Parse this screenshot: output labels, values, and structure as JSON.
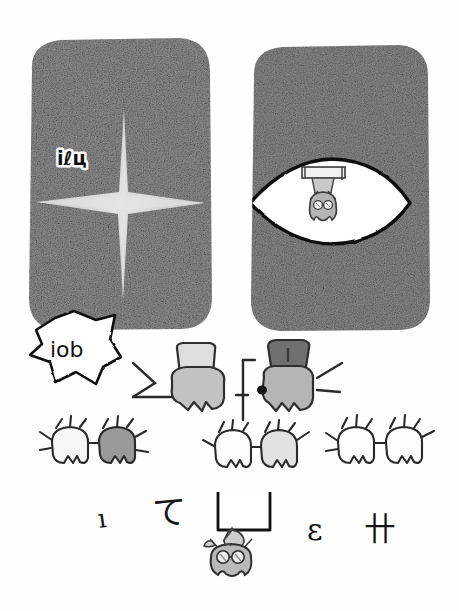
{
  "artwork": {
    "title": "Hand-drawn comic sketch: two grainy panels with creatures",
    "medium": "pencil-sketch",
    "background_color": "#fefefe",
    "ink_color": "#1a1a1a"
  },
  "panels": [
    {
      "id": "left-panel",
      "label": "left-grainy-panel",
      "x": 26,
      "y": 38,
      "width": 188,
      "height": 293,
      "fill": "#8f8f8f",
      "texture": "heavy-noise",
      "contents": {
        "sparkle": {
          "label": "cross-sparkle-shape",
          "center_x": 124,
          "center_y": 205,
          "color": "#d8d8d8"
        },
        "caption": {
          "label": "panel-caption-text",
          "text": "iℓц",
          "x": 57,
          "y": 158,
          "style": "outlined-handwritten"
        }
      }
    },
    {
      "id": "right-panel",
      "label": "right-grainy-panel",
      "x": 248,
      "y": 45,
      "width": 184,
      "height": 286,
      "fill": "#8a8a8a",
      "texture": "heavy-noise",
      "contents": {
        "eye_opening": {
          "label": "eye-shaped-white-opening",
          "center_x": 330,
          "center_y": 202,
          "rx": 82,
          "ry": 41,
          "fill": "#ffffff",
          "stroke": "#111111"
        },
        "hanging_creature": {
          "label": "hanging-bat-creature",
          "x": 296,
          "y": 170,
          "body_fill": "#b4b4b4",
          "has_goggles": true,
          "bar_fill": "#e9e9e9"
        }
      }
    }
  ],
  "speech_bubble": {
    "label": "jagged-speech-bubble",
    "x": 30,
    "y": 312,
    "width": 88,
    "height": 72,
    "fill": "#ffffff",
    "stroke": "#111111",
    "text": "iοb"
  },
  "figures": {
    "big_left": {
      "label": "big-figure-light",
      "body_x": 175,
      "body_y": 368,
      "head_fill": "#dedede",
      "body_fill": "#c2c2c2",
      "arms": "raised-outward"
    },
    "big_right": {
      "label": "big-figure-dark-head",
      "body_x": 285,
      "body_y": 368,
      "head_fill": "#707070",
      "body_fill": "#b5b5b5",
      "arms": "raised-outward",
      "has_dark_dot": true
    },
    "small_creatures": [
      {
        "label": "small-creature-1",
        "x": 62,
        "y": 440,
        "fill": "#f6f6f6"
      },
      {
        "label": "small-creature-2",
        "x": 110,
        "y": 440,
        "fill": "#9a9a9a"
      },
      {
        "label": "small-creature-3",
        "x": 225,
        "y": 443,
        "fill": "#fdfdfd"
      },
      {
        "label": "small-creature-4",
        "x": 272,
        "y": 443,
        "fill": "#e2e2e2"
      },
      {
        "label": "small-creature-5",
        "x": 348,
        "y": 440,
        "fill": "#fdfdfd"
      },
      {
        "label": "small-creature-6",
        "x": 398,
        "y": 440,
        "fill": "#fdfdfd"
      }
    ]
  },
  "bottom_scene": {
    "ledge": {
      "label": "ceiling-ledge",
      "x": 218,
      "y": 493,
      "width": 52,
      "height": 36,
      "fill": "#ffffff",
      "stroke": "#111111"
    },
    "hanging_creature": {
      "label": "bottom-hanging-creature",
      "x": 210,
      "y": 525,
      "body_fill": "#b9b9b9",
      "has_goggles": true
    },
    "glyphs": [
      {
        "label": "glyph-left-1",
        "text": "ı",
        "x": 104,
        "y": 524,
        "rotation": -10
      },
      {
        "label": "glyph-left-2",
        "text": "て",
        "x": 158,
        "y": 512,
        "rotation": 0
      },
      {
        "label": "glyph-right-1",
        "text": "ε",
        "x": 314,
        "y": 534,
        "rotation": 0
      },
      {
        "label": "glyph-right-2",
        "text": "卄",
        "x": 370,
        "y": 530,
        "rotation": 0
      }
    ]
  }
}
